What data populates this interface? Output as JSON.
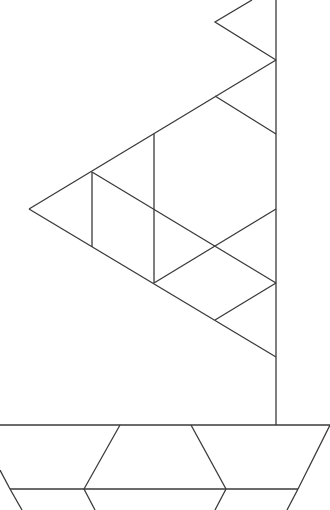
{
  "diagram": {
    "stroke_color": "#3a3a3a",
    "background": "#ffffff",
    "mast": {
      "x": 276,
      "y1": 0,
      "y2": 425
    },
    "pennant": [
      [
        252,
        0
      ],
      [
        215,
        22
      ],
      [
        276,
        60
      ]
    ],
    "sail_segments": [
      [
        276,
        60,
        29,
        209
      ],
      [
        29,
        209,
        276,
        357
      ],
      [
        92,
        172,
        92,
        247
      ],
      [
        154,
        134,
        154,
        283
      ],
      [
        215,
        96,
        276,
        134
      ],
      [
        92,
        172,
        276,
        283
      ],
      [
        276,
        209,
        154,
        283
      ],
      [
        276,
        283,
        215,
        320
      ]
    ],
    "deck_y": 425,
    "hull_segments": [
      [
        0,
        425,
        330,
        425
      ],
      [
        120,
        425,
        84,
        489
      ],
      [
        191,
        425,
        226,
        489
      ],
      [
        330,
        425,
        298,
        489
      ],
      [
        10,
        489,
        298,
        489
      ],
      [
        0,
        470,
        10,
        489
      ],
      [
        10,
        489,
        22,
        510
      ],
      [
        84,
        489,
        95,
        510
      ],
      [
        226,
        489,
        215,
        510
      ],
      [
        298,
        489,
        287,
        510
      ]
    ]
  }
}
